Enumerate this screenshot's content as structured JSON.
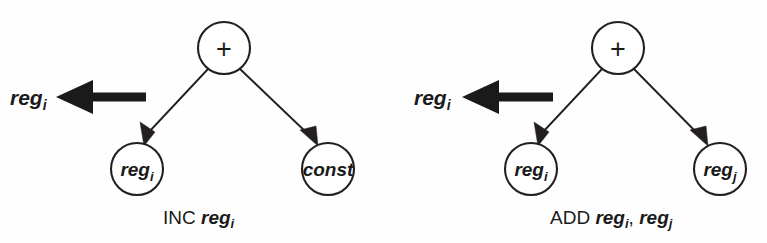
{
  "figure": {
    "background_color": "#fefefe",
    "line_color": "#231f20",
    "text_color": "#1a1a1a"
  },
  "trees": [
    {
      "id": "inc-tree",
      "root": {
        "label": "+",
        "name": "plus-operator"
      },
      "children": [
        {
          "label": "reg",
          "subscript": "i",
          "name": "reg-i-node"
        },
        {
          "label": "const",
          "subscript": "",
          "name": "const-node"
        }
      ],
      "result": {
        "label": "reg",
        "subscript": "i"
      },
      "caption": {
        "op": "INC",
        "arg1": "reg",
        "arg1_sub": "i",
        "arg2": "",
        "arg2_sub": ""
      }
    },
    {
      "id": "add-tree",
      "root": {
        "label": "+",
        "name": "plus-operator"
      },
      "children": [
        {
          "label": "reg",
          "subscript": "i",
          "name": "reg-i-node"
        },
        {
          "label": "reg",
          "subscript": "j",
          "name": "reg-j-node"
        }
      ],
      "result": {
        "label": "reg",
        "subscript": "i"
      },
      "caption": {
        "op": "ADD",
        "arg1": "reg",
        "arg1_sub": "i",
        "comma": ",",
        "arg2": "reg",
        "arg2_sub": "j"
      }
    }
  ]
}
